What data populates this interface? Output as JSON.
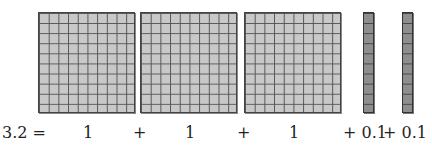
{
  "diagram": {
    "blocks": [
      {
        "type": "flat",
        "value": "1",
        "grid": "10x10"
      },
      {
        "type": "flat",
        "value": "1",
        "grid": "10x10"
      },
      {
        "type": "flat",
        "value": "1",
        "grid": "10x10"
      },
      {
        "type": "rod",
        "value": "0.1",
        "grid": "1x10"
      },
      {
        "type": "rod",
        "value": "0.1",
        "grid": "1x10"
      }
    ],
    "equation": {
      "lhs": "3.2 =",
      "terms": [
        "1",
        "+",
        "1",
        "+",
        "1",
        "+ 0.1",
        "+ 0.1"
      ]
    },
    "colors": {
      "flat": "#c8c8c8",
      "rod": "#8e8e8e",
      "grid": "#555555"
    }
  }
}
